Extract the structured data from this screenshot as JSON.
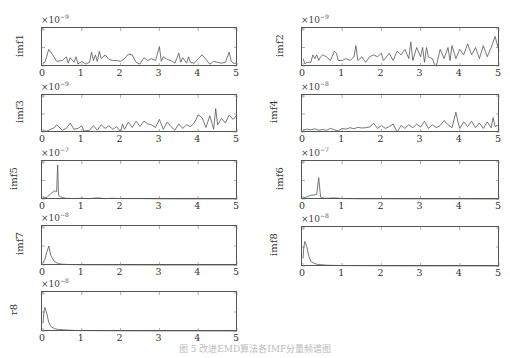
{
  "chart_data": [
    {
      "type": "line",
      "ylabel": "imf1",
      "exponent": "-9",
      "ylim": [
        0,
        4
      ],
      "yticks": [
        "0",
        "2",
        "4"
      ],
      "xlim": [
        0,
        5
      ],
      "xticks": [
        "0",
        "1",
        "2",
        "3",
        "4",
        "5"
      ],
      "x": [
        0,
        0.05,
        0.15,
        0.25,
        0.35,
        0.5,
        0.6,
        0.65,
        0.7,
        0.8,
        0.85,
        0.9,
        1.0,
        1.1,
        1.2,
        1.25,
        1.3,
        1.35,
        1.4,
        1.45,
        1.5,
        1.6,
        1.7,
        1.8,
        1.9,
        2.0,
        2.1,
        2.2,
        2.3,
        2.4,
        2.5,
        2.6,
        2.7,
        2.8,
        2.9,
        3.0,
        3.05,
        3.1,
        3.2,
        3.3,
        3.4,
        3.5,
        3.55,
        3.6,
        3.7,
        3.75,
        3.8,
        3.9,
        4.0,
        4.1,
        4.2,
        4.3,
        4.4,
        4.5,
        4.6,
        4.7,
        4.8,
        4.85,
        4.9,
        5.0
      ],
      "values": [
        0.3,
        0.4,
        1.8,
        1.2,
        0.5,
        0.6,
        1.0,
        0.3,
        0.9,
        0.4,
        1.0,
        0.2,
        0.5,
        0.2,
        0.4,
        1.5,
        0.6,
        1.2,
        0.5,
        1.6,
        0.8,
        1.2,
        0.7,
        0.6,
        0.6,
        0.5,
        0.8,
        1.3,
        1.2,
        0.4,
        0.2,
        0.9,
        0.6,
        0.8,
        0.6,
        2.1,
        0.5,
        1.0,
        0.7,
        0.6,
        0.3,
        1.4,
        0.4,
        0.9,
        0.3,
        1.0,
        0.4,
        0.3,
        0.8,
        1.2,
        0.7,
        0.2,
        0.5,
        0.4,
        0.3,
        0.4,
        1.5,
        0.5,
        0.3,
        0.3
      ]
    },
    {
      "type": "line",
      "ylabel": "imf2",
      "exponent": "-9",
      "ylim": [
        0,
        2
      ],
      "yticks": [
        "0",
        "1",
        "2"
      ],
      "xlim": [
        0,
        5
      ],
      "xticks": [
        "0",
        "1",
        "2",
        "3",
        "4",
        "5"
      ],
      "x": [
        0,
        0.05,
        0.1,
        0.2,
        0.25,
        0.3,
        0.35,
        0.4,
        0.45,
        0.5,
        0.6,
        0.7,
        0.8,
        0.85,
        0.9,
        1.0,
        1.1,
        1.2,
        1.3,
        1.35,
        1.4,
        1.5,
        1.6,
        1.7,
        1.8,
        1.9,
        2.0,
        2.05,
        2.1,
        2.2,
        2.3,
        2.4,
        2.5,
        2.6,
        2.7,
        2.75,
        2.8,
        2.9,
        3.0,
        3.05,
        3.1,
        3.15,
        3.2,
        3.3,
        3.35,
        3.4,
        3.5,
        3.6,
        3.7,
        3.75,
        3.8,
        3.9,
        4.0,
        4.1,
        4.2,
        4.3,
        4.4,
        4.5,
        4.6,
        4.7,
        4.8,
        4.9,
        5.0
      ],
      "values": [
        0.4,
        0.1,
        0.2,
        0.2,
        0.6,
        0.4,
        0.6,
        0.3,
        0.5,
        0.6,
        0.5,
        0.3,
        0.8,
        0.7,
        0.3,
        0.3,
        0.4,
        0.3,
        0.5,
        1.1,
        0.3,
        0.5,
        0.2,
        0.5,
        0.6,
        0.5,
        0.7,
        0.3,
        0.4,
        0.7,
        0.3,
        0.8,
        0.6,
        0.9,
        0.4,
        1.3,
        0.3,
        1.0,
        0.5,
        1.0,
        0.2,
        1.0,
        0.5,
        0.4,
        0.1,
        0.0,
        0.9,
        0.4,
        1.0,
        0.3,
        1.1,
        0.4,
        0.9,
        0.6,
        1.2,
        0.6,
        1.0,
        0.4,
        1.1,
        0.5,
        1.0,
        1.6,
        0.8
      ]
    },
    {
      "type": "line",
      "ylabel": "imf3",
      "exponent": "-9",
      "ylim": [
        0,
        4
      ],
      "yticks": [
        "0",
        "2",
        "4"
      ],
      "xlim": [
        0,
        5
      ],
      "xticks": [
        "0",
        "1",
        "2",
        "3",
        "4",
        "5"
      ],
      "x": [
        0,
        0.1,
        0.2,
        0.3,
        0.35,
        0.5,
        0.6,
        0.7,
        0.8,
        0.9,
        1.0,
        1.05,
        1.2,
        1.3,
        1.4,
        1.5,
        1.6,
        1.7,
        1.8,
        1.9,
        2.0,
        2.05,
        2.1,
        2.2,
        2.3,
        2.4,
        2.5,
        2.6,
        2.7,
        2.8,
        2.9,
        3.0,
        3.1,
        3.2,
        3.3,
        3.4,
        3.5,
        3.6,
        3.7,
        3.8,
        3.9,
        4.0,
        4.1,
        4.2,
        4.3,
        4.4,
        4.45,
        4.5,
        4.6,
        4.7,
        4.8,
        4.9,
        5.0
      ],
      "values": [
        0.1,
        0.1,
        0.3,
        0.5,
        0.8,
        0.2,
        0.4,
        1.0,
        0.3,
        0.4,
        0.7,
        0.1,
        0.2,
        0.7,
        0.2,
        0.8,
        0.4,
        0.7,
        0.3,
        0.6,
        0.0,
        0.9,
        0.3,
        1.1,
        0.5,
        1.2,
        0.6,
        1.2,
        0.9,
        0.8,
        0.5,
        1.4,
        0.3,
        1.1,
        0.6,
        0.2,
        0.9,
        0.4,
        0.8,
        0.6,
        1.0,
        1.9,
        1.6,
        0.5,
        1.8,
        0.3,
        2.6,
        0.8,
        1.5,
        1.0,
        1.9,
        1.4,
        1.9
      ]
    },
    {
      "type": "line",
      "ylabel": "imf4",
      "exponent": "-8",
      "ylim": [
        0,
        1
      ],
      "yticks": [
        "0",
        "0.5",
        "1"
      ],
      "xlim": [
        0,
        5
      ],
      "xticks": [
        "0",
        "1",
        "2",
        "3",
        "4",
        "5"
      ],
      "x": [
        0,
        0.1,
        0.2,
        0.3,
        0.4,
        0.5,
        0.6,
        0.7,
        0.8,
        0.9,
        1.0,
        1.1,
        1.2,
        1.3,
        1.4,
        1.5,
        1.6,
        1.7,
        1.8,
        1.9,
        2.0,
        2.1,
        2.2,
        2.3,
        2.4,
        2.5,
        2.6,
        2.7,
        2.8,
        2.9,
        3.0,
        3.1,
        3.2,
        3.3,
        3.4,
        3.5,
        3.6,
        3.7,
        3.8,
        3.9,
        3.95,
        4.0,
        4.1,
        4.2,
        4.3,
        4.4,
        4.5,
        4.6,
        4.7,
        4.8,
        4.85,
        4.9,
        5.0
      ],
      "values": [
        0.05,
        0.08,
        0.06,
        0.09,
        0.05,
        0.07,
        0.05,
        0.1,
        0.06,
        0.03,
        0.1,
        0.08,
        0.12,
        0.09,
        0.13,
        0.11,
        0.12,
        0.14,
        0.24,
        0.1,
        0.18,
        0.1,
        0.15,
        0.22,
        0.0,
        0.18,
        0.1,
        0.2,
        0.12,
        0.22,
        0.14,
        0.3,
        0.1,
        0.2,
        0.12,
        0.18,
        0.32,
        0.2,
        0.12,
        0.55,
        0.3,
        0.1,
        0.28,
        0.15,
        0.3,
        0.12,
        0.25,
        0.1,
        0.28,
        0.12,
        0.4,
        0.15,
        0.2
      ]
    },
    {
      "type": "line",
      "ylabel": "imf5",
      "exponent": "-7",
      "ylim": [
        0,
        1
      ],
      "yticks": [
        "0",
        "0.5",
        "1"
      ],
      "xlim": [
        0,
        5
      ],
      "xticks": [
        "0",
        "1",
        "2",
        "3",
        "4",
        "5"
      ],
      "x": [
        0,
        0.1,
        0.2,
        0.3,
        0.35,
        0.38,
        0.4,
        0.45,
        0.5,
        0.6,
        0.8,
        1.0,
        1.2,
        1.4,
        1.6,
        1.8,
        2.0,
        2.5,
        3.0,
        4.0,
        5.0
      ],
      "values": [
        0.05,
        0.04,
        0.15,
        0.22,
        0.2,
        0.92,
        0.1,
        0.06,
        0.04,
        0.02,
        0.01,
        0.02,
        0.01,
        0.03,
        0.01,
        0.02,
        0.01,
        0.01,
        0.005,
        0.003,
        0.002
      ]
    },
    {
      "type": "line",
      "ylabel": "imf6",
      "exponent": "-7",
      "ylim": [
        0,
        2
      ],
      "yticks": [
        "0",
        "1",
        "2"
      ],
      "xlim": [
        0,
        5
      ],
      "xticks": [
        "0",
        "1",
        "2",
        "3",
        "4",
        "5"
      ],
      "x": [
        0,
        0.1,
        0.2,
        0.3,
        0.35,
        0.4,
        0.45,
        0.5,
        0.6,
        0.8,
        1.0,
        1.5,
        2.0,
        3.0,
        4.0,
        5.0
      ],
      "values": [
        0.05,
        0.12,
        0.2,
        0.22,
        0.25,
        1.15,
        0.1,
        0.06,
        0.04,
        0.06,
        0.02,
        0.01,
        0.01,
        0.005,
        0.003,
        0.002
      ]
    },
    {
      "type": "line",
      "ylabel": "imf7",
      "exponent": "-8",
      "ylim": [
        0,
        4
      ],
      "yticks": [
        "0",
        "2",
        "4"
      ],
      "xlim": [
        0,
        5
      ],
      "xticks": [
        "0",
        "1",
        "2",
        "3",
        "4",
        "5"
      ],
      "x": [
        0,
        0.05,
        0.1,
        0.15,
        0.2,
        0.3,
        0.4,
        0.5,
        0.7,
        1.0,
        2.0,
        3.0,
        4.0,
        5.0
      ],
      "values": [
        0.2,
        0.6,
        1.4,
        2.0,
        1.0,
        0.35,
        0.15,
        0.08,
        0.04,
        0.02,
        0.01,
        0.005,
        0.003,
        0.002
      ]
    },
    {
      "type": "line",
      "ylabel": "imf8",
      "exponent": "-8",
      "ylim": [
        0,
        1
      ],
      "yticks": [
        "0",
        "0.5",
        "1"
      ],
      "xlim": [
        0,
        5
      ],
      "xticks": [
        "0",
        "1",
        "2",
        "3",
        "4",
        "5"
      ],
      "x": [
        0,
        0.02,
        0.05,
        0.1,
        0.15,
        0.2,
        0.3,
        0.4,
        0.6,
        0.8,
        1.0,
        2.0,
        3.0,
        4.0,
        5.0
      ],
      "values": [
        0.2,
        0.5,
        0.65,
        0.5,
        0.25,
        0.12,
        0.06,
        0.04,
        0.02,
        0.015,
        0.01,
        0.005,
        0.003,
        0.002,
        0.001
      ]
    },
    {
      "type": "line",
      "ylabel": "r8",
      "exponent": "-8",
      "ylim": [
        0,
        1
      ],
      "yticks": [
        "0",
        "0.5",
        "1"
      ],
      "xlim": [
        0,
        5
      ],
      "xticks": [
        "0",
        "1",
        "2",
        "3",
        "4",
        "5"
      ],
      "x": [
        0,
        0.02,
        0.05,
        0.1,
        0.15,
        0.2,
        0.3,
        0.4,
        0.6,
        0.8,
        1.0,
        2.0,
        3.0,
        4.0,
        5.0
      ],
      "values": [
        0.2,
        0.5,
        0.62,
        0.45,
        0.22,
        0.12,
        0.06,
        0.04,
        0.025,
        0.015,
        0.01,
        0.005,
        0.003,
        0.002,
        0.001
      ]
    }
  ],
  "layout": {
    "panels": [
      {
        "left": 41,
        "top": 27,
        "width": 196,
        "height": 39
      },
      {
        "left": 301,
        "top": 27,
        "width": 198,
        "height": 39
      },
      {
        "left": 41,
        "top": 94,
        "width": 196,
        "height": 38
      },
      {
        "left": 301,
        "top": 94,
        "width": 198,
        "height": 38
      },
      {
        "left": 41,
        "top": 160,
        "width": 196,
        "height": 39
      },
      {
        "left": 301,
        "top": 160,
        "width": 198,
        "height": 39
      },
      {
        "left": 41,
        "top": 225,
        "width": 196,
        "height": 40
      },
      {
        "left": 301,
        "top": 226,
        "width": 198,
        "height": 40
      },
      {
        "left": 41,
        "top": 291,
        "width": 196,
        "height": 40
      }
    ],
    "line_color": "#555555",
    "axis_color": "#555555"
  },
  "caption": "图 5  改进EMD算法各IMF分量频谱图"
}
